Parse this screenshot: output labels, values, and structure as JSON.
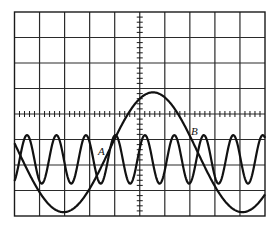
{
  "figure": {
    "type": "oscilloscope-display",
    "grid": {
      "horizontal_divisions": 10,
      "vertical_divisions": 8,
      "minor_ticks_per_division": 5
    },
    "traces": [
      {
        "name": "low-frequency-sine",
        "cycles_across_screen": 1.4,
        "amplitude_divisions": 2.35,
        "offset_divisions": -1.5
      },
      {
        "name": "high-frequency-sine",
        "cycles_across_screen": 8.5,
        "amplitude_divisions": 0.95,
        "offset_divisions": -1.78
      }
    ],
    "labels": [
      {
        "id": "A",
        "text": "A"
      },
      {
        "id": "B",
        "text": "B"
      }
    ]
  }
}
